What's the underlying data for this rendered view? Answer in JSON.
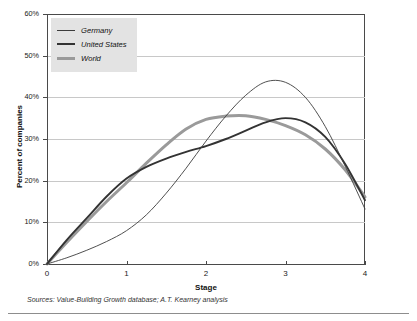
{
  "chart_data": {
    "type": "line",
    "title": "",
    "xlabel": "Stage",
    "ylabel": "Percent of companies",
    "xlim": [
      0,
      4
    ],
    "ylim": [
      0,
      60
    ],
    "grid": true,
    "legend_position": "top-left",
    "xticks": [
      "0",
      "1",
      "2",
      "3",
      "4"
    ],
    "yticks": [
      "0%",
      "10%",
      "20%",
      "30%",
      "40%",
      "50%",
      "60%"
    ],
    "x": [
      0,
      0.25,
      0.5,
      0.75,
      1,
      1.25,
      1.5,
      1.75,
      2,
      2.25,
      2.5,
      2.75,
      3,
      3.25,
      3.5,
      3.75,
      4
    ],
    "series": [
      {
        "name": "Germany",
        "color": "#3c3c3c",
        "width": 0.9,
        "values": [
          0,
          1.5,
          3.3,
          5.4,
          8.0,
          11.8,
          17.0,
          23.0,
          29.5,
          35.5,
          40.5,
          43.7,
          43.6,
          40.0,
          33.0,
          23.5,
          13.2
        ]
      },
      {
        "name": "United States",
        "color": "#333333",
        "width": 1.9,
        "values": [
          0,
          5.8,
          11.0,
          16.2,
          20.5,
          23.3,
          25.3,
          26.9,
          28.3,
          30.0,
          32.0,
          34.0,
          35.0,
          34.0,
          30.5,
          24.0,
          15.3
        ]
      },
      {
        "name": "World",
        "color": "#9a9a9a",
        "width": 3.0,
        "values": [
          0,
          5.2,
          10.2,
          15.0,
          19.5,
          24.2,
          28.6,
          32.4,
          34.7,
          35.5,
          35.6,
          34.7,
          33.2,
          31.0,
          27.6,
          22.6,
          16.1
        ]
      }
    ]
  },
  "legend": {
    "entries": [
      {
        "label": "Germany"
      },
      {
        "label": "United States"
      },
      {
        "label": "World"
      }
    ]
  },
  "axes": {
    "x_title": "Stage",
    "y_title": "Percent of companies"
  },
  "footer": {
    "source": "Sources: Value-Building Growth database; A.T. Kearney analysis"
  }
}
